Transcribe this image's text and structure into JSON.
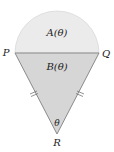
{
  "diagram": {
    "labels": {
      "P": "P",
      "Q": "Q",
      "R": "R",
      "region_A": "A(θ)",
      "region_B": "B(θ)",
      "angle": "θ"
    },
    "colors": {
      "semicircle_fill": "#ebebeb",
      "triangle_fill": "#d6d6d6",
      "stroke": "#8a8a8a"
    }
  }
}
